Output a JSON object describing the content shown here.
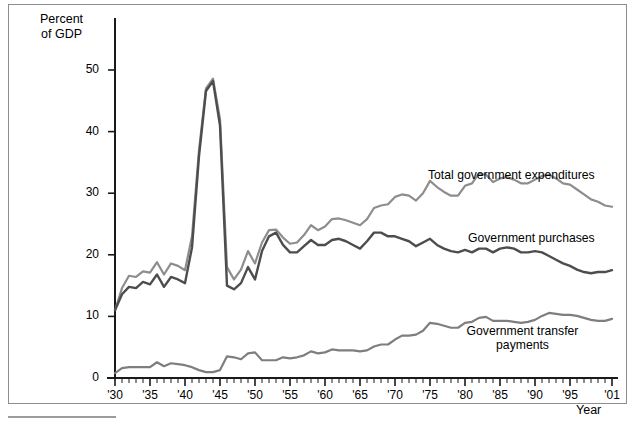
{
  "figure": {
    "y_axis_title": "Percent\nof GDP",
    "x_axis_title": "Year"
  },
  "chart_data": {
    "type": "line",
    "title": "",
    "subtitle": "",
    "xlabel": "Year",
    "ylabel": "Percent of GDP",
    "xlim": [
      1930,
      2001
    ],
    "ylim": [
      0,
      55
    ],
    "grid": false,
    "legend_position": "inline-right-annotations",
    "y_ticks": [
      0,
      10,
      20,
      30,
      40,
      50
    ],
    "y_tick_labels": [
      "0",
      "10",
      "20",
      "30",
      "40",
      "50"
    ],
    "x_ticks": [
      1930,
      1935,
      1940,
      1945,
      1950,
      1955,
      1960,
      1965,
      1970,
      1975,
      1980,
      1985,
      1990,
      1995,
      2001
    ],
    "x_tick_labels": [
      "'30",
      "'35",
      "'40",
      "'45",
      "'50",
      "'55",
      "'60",
      "'65",
      "'70",
      "'75",
      "'80",
      "'85",
      "'90",
      "'95",
      "'01"
    ],
    "x_minor_tick_interval": 1,
    "colors": {
      "total_government_expenditures": "#8d8d8d",
      "government_purchases": "#4d4d4d",
      "government_transfer_payments": "#7e7e7e"
    },
    "x": [
      1930,
      1931,
      1932,
      1933,
      1934,
      1935,
      1936,
      1937,
      1938,
      1939,
      1940,
      1941,
      1942,
      1943,
      1944,
      1945,
      1946,
      1947,
      1948,
      1949,
      1950,
      1951,
      1952,
      1953,
      1954,
      1955,
      1956,
      1957,
      1958,
      1959,
      1960,
      1961,
      1962,
      1963,
      1964,
      1965,
      1966,
      1967,
      1968,
      1969,
      1970,
      1971,
      1972,
      1973,
      1974,
      1975,
      1976,
      1977,
      1978,
      1979,
      1980,
      1981,
      1982,
      1983,
      1984,
      1985,
      1986,
      1987,
      1988,
      1989,
      1990,
      1991,
      1992,
      1993,
      1994,
      1995,
      1996,
      1997,
      1998,
      1999,
      2000,
      2001
    ],
    "series": [
      {
        "name": "Total government expenditures",
        "color": "#8d8d8d",
        "label_annotation": "Total government expenditures",
        "values": [
          11.0,
          14.6,
          16.6,
          16.4,
          17.3,
          17.1,
          18.8,
          16.8,
          18.6,
          18.2,
          17.5,
          23.0,
          37.0,
          47.0,
          48.6,
          42.0,
          18.0,
          16.0,
          17.6,
          20.6,
          18.6,
          22.0,
          24.0,
          24.1,
          22.8,
          21.8,
          22.0,
          23.2,
          24.8,
          24.0,
          24.6,
          25.8,
          25.9,
          25.6,
          25.2,
          24.8,
          25.8,
          27.6,
          28.0,
          28.2,
          29.4,
          29.8,
          29.6,
          28.8,
          30.0,
          32.0,
          31.0,
          30.2,
          29.6,
          29.6,
          31.2,
          31.6,
          33.2,
          33.0,
          31.8,
          32.4,
          32.6,
          32.2,
          31.6,
          31.6,
          32.2,
          32.8,
          33.0,
          32.4,
          31.6,
          31.4,
          30.6,
          29.8,
          29.0,
          28.6,
          28.0,
          27.8
        ]
      },
      {
        "name": "Government purchases",
        "color": "#4d4d4d",
        "label_annotation": "Government purchases",
        "values": [
          11.0,
          13.6,
          14.8,
          14.6,
          15.6,
          15.2,
          16.8,
          14.8,
          16.4,
          16.0,
          15.4,
          21.2,
          36.0,
          46.6,
          48.2,
          41.0,
          15.0,
          14.4,
          15.4,
          18.0,
          16.0,
          20.6,
          23.0,
          23.6,
          21.6,
          20.4,
          20.4,
          21.4,
          22.4,
          21.6,
          21.6,
          22.4,
          22.6,
          22.2,
          21.6,
          21.0,
          22.2,
          23.6,
          23.6,
          23.0,
          23.0,
          22.6,
          22.2,
          21.4,
          22.0,
          22.6,
          21.6,
          21.0,
          20.6,
          20.4,
          20.8,
          20.4,
          21.0,
          21.0,
          20.4,
          21.0,
          21.2,
          21.0,
          20.4,
          20.4,
          20.6,
          20.4,
          19.8,
          19.2,
          18.6,
          18.2,
          17.6,
          17.2,
          17.0,
          17.2,
          17.2,
          17.5
        ]
      },
      {
        "name": "Government transfer payments",
        "color": "#7e7e7e",
        "label_annotation": "Government transfer payments",
        "values": [
          1.0,
          2.0,
          2.2,
          2.2,
          2.2,
          2.2,
          3.2,
          2.4,
          3.0,
          2.8,
          2.6,
          2.2,
          1.6,
          1.2,
          1.2,
          1.6,
          4.4,
          4.2,
          3.8,
          5.0,
          5.2,
          3.6,
          3.6,
          3.6,
          4.2,
          4.0,
          4.2,
          4.6,
          5.4,
          5.0,
          5.2,
          5.8,
          5.6,
          5.6,
          5.6,
          5.4,
          5.6,
          6.4,
          6.8,
          6.8,
          7.8,
          8.6,
          8.6,
          8.8,
          9.6,
          11.2,
          11.0,
          10.6,
          10.2,
          10.2,
          11.2,
          11.4,
          12.2,
          12.4,
          11.6,
          11.6,
          11.6,
          11.4,
          11.2,
          11.4,
          11.8,
          12.6,
          13.2,
          13.0,
          12.8,
          12.8,
          12.6,
          12.2,
          11.8,
          11.6,
          11.6,
          12.0
        ]
      }
    ]
  }
}
